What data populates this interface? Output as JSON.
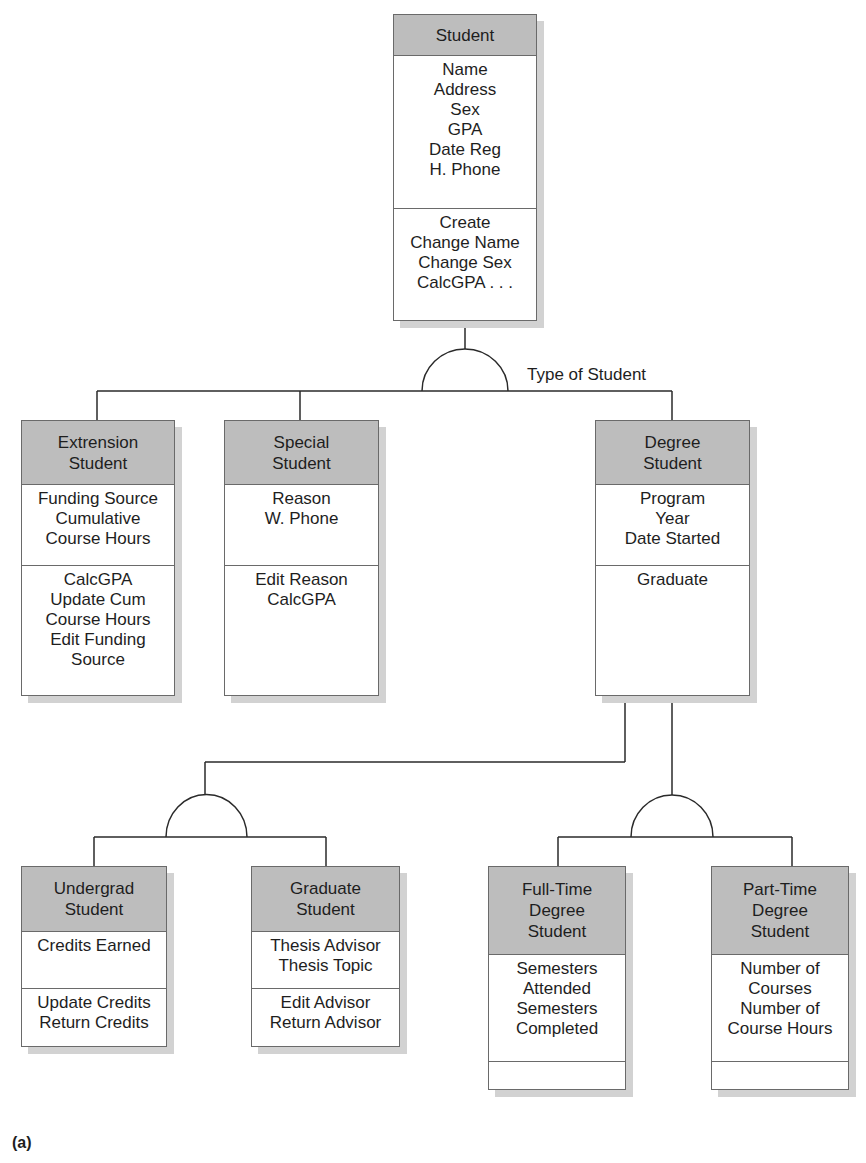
{
  "diagram": {
    "caption": "(a)",
    "generalizations": [
      {
        "label": "Type of Student",
        "parent": "Student",
        "children": [
          "Extrension Student",
          "Special Student",
          "Degree Student"
        ]
      },
      {
        "label": "",
        "parent": "Degree Student",
        "children": [
          "Undergrad Student",
          "Graduate Student"
        ]
      },
      {
        "label": "",
        "parent": "Degree Student",
        "children": [
          "Full-Time Degree Student",
          "Part-Time Degree Student"
        ]
      }
    ],
    "classes": {
      "student": {
        "name": [
          "Student"
        ],
        "attributes": [
          "Name",
          "Address",
          "Sex",
          "GPA",
          "Date Reg",
          "H. Phone"
        ],
        "methods": [
          "Create",
          "Change Name",
          "Change Sex",
          "CalcGPA . . ."
        ]
      },
      "extension": {
        "name": [
          "Extrension",
          "Student"
        ],
        "attributes": [
          "Funding Source",
          "Cumulative",
          "Course Hours"
        ],
        "methods": [
          "CalcGPA",
          "Update Cum",
          "Course Hours",
          "Edit Funding",
          "Source"
        ]
      },
      "special": {
        "name": [
          "Special",
          "Student"
        ],
        "attributes": [
          "Reason",
          "W. Phone"
        ],
        "methods": [
          "Edit Reason",
          "CalcGPA"
        ]
      },
      "degree": {
        "name": [
          "Degree",
          "Student"
        ],
        "attributes": [
          "Program",
          "Year",
          "Date Started"
        ],
        "methods": [
          "Graduate"
        ]
      },
      "undergrad": {
        "name": [
          "Undergrad",
          "Student"
        ],
        "attributes": [
          "Credits Earned"
        ],
        "methods": [
          "Update Credits",
          "Return Credits"
        ]
      },
      "graduate": {
        "name": [
          "Graduate",
          "Student"
        ],
        "attributes": [
          "Thesis Advisor",
          "Thesis Topic"
        ],
        "methods": [
          "Edit Advisor",
          "Return Advisor"
        ]
      },
      "fulltime": {
        "name": [
          "Full-Time",
          "Degree",
          "Student"
        ],
        "attributes": [
          "Semesters",
          "Attended",
          "Semesters",
          "Completed"
        ],
        "methods": []
      },
      "parttime": {
        "name": [
          "Part-Time",
          "Degree",
          "Student"
        ],
        "attributes": [
          "Number of",
          "Courses",
          "Number of",
          "Course Hours"
        ],
        "methods": []
      }
    }
  },
  "colors": {
    "header_fill": "#bdbdbd",
    "border": "#6a6a6a",
    "line": "#2a2a2a",
    "shadow": "#d2d2d2"
  }
}
